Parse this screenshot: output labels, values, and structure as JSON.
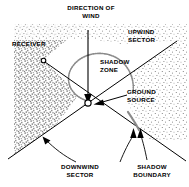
{
  "figure": {
    "width": 189,
    "height": 187,
    "background_color": "#ffffff",
    "ink_color": "#000000"
  },
  "labels": {
    "direction_of_wind": "DIRECTION OF\nWIND",
    "upwind_sector": "UPWIND\nSECTOR",
    "receiver": "RECEIVER",
    "shadow_zone": "SHADOW\nZONE",
    "ground_source": "GROUND\nSOURCE",
    "downwind_sector": "DOWNWIND\nSECTOR",
    "shadow_boundary": "SHADOW\nBOUNDARY"
  },
  "markers": {
    "ground_source_point": {
      "x": 88,
      "y": 103,
      "shape": "open-circle"
    },
    "receiver_point": {
      "x": 43,
      "y": 60,
      "shape": "open-circle"
    }
  },
  "regions": [
    {
      "name": "upwind-sector-stipple-left",
      "fill": "stipple-dense",
      "description": "Dense stippled area occupying the upper-left wedge, bounded below-left by a curved shadow boundary"
    },
    {
      "name": "upwind-sector-stipple-right",
      "fill": "stipple-sparse",
      "description": "Lighter stippled area in the upper-right upwind sector"
    },
    {
      "name": "shadow-zone",
      "fill": "none",
      "description": "Unstippled lens-shaped region above the ground source, bounded by an arc"
    }
  ],
  "annotations": {
    "wind_arrow": {
      "from": {
        "x": 88,
        "y": 30
      },
      "to": {
        "x": 88,
        "y": 101
      },
      "style": "arrow-down"
    },
    "ground_source_leader": {
      "from": {
        "x": 126,
        "y": 95
      },
      "to": {
        "x": 94,
        "y": 104
      },
      "style": "arrow-left"
    },
    "downwind_leader": {
      "style": "curved-arc-with-arrowhead",
      "arrow_at": {
        "x": 44,
        "y": 138
      }
    },
    "shadow_boundary_leaders": {
      "style": "two-arrowheads",
      "arrow_at": [
        {
          "x": 134,
          "y": 132
        },
        {
          "x": 141,
          "y": 132
        }
      ]
    }
  },
  "rays": [
    {
      "name": "receiver-to-source-ray",
      "from": {
        "x": 43,
        "y": 60
      },
      "to": {
        "x": 185,
        "y": 160
      }
    },
    {
      "name": "downwind-left-ray",
      "from": {
        "x": 88,
        "y": 103
      },
      "to": {
        "x": 10,
        "y": 158
      }
    },
    {
      "name": "upwind-right-ray",
      "from": {
        "x": 88,
        "y": 103
      },
      "to": {
        "x": 176,
        "y": 42
      }
    }
  ],
  "colors": {
    "ink": "#000000",
    "stipple_dense": "#6a6a6a",
    "stipple_sparse": "#a8a8a8",
    "paper": "#ffffff"
  }
}
